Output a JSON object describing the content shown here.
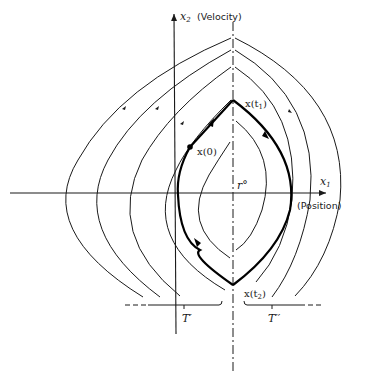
{
  "diagram": {
    "type": "phase-plane trajectory diagram",
    "axes": {
      "x_axis_label": "x",
      "x_axis_subscript": "1",
      "x_axis_caption": "(Position)",
      "y_axis_label": "x",
      "y_axis_subscript": "2",
      "y_axis_caption": "(Velocity)"
    },
    "labels": {
      "initial_state": "x(0)",
      "state_t1_prefix": "x(t",
      "state_t1_sub": "1",
      "state_t2_prefix": "x(t",
      "state_t2_sub": "2",
      "close_paren": ")",
      "target": "r°",
      "region_left": "T′",
      "region_right": "T′′"
    },
    "colors": {
      "ink": "#1a1a1a",
      "background": "#ffffff"
    }
  }
}
